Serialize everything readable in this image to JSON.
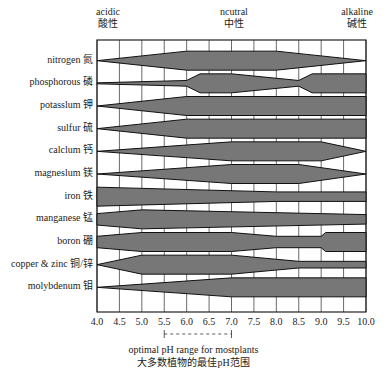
{
  "headers": {
    "acidic_en": "acidic",
    "acidic_zh": "酸性",
    "neutral_en": "ncutral",
    "neutral_zh": "中性",
    "alkaline_en": "alkaline",
    "alkaline_zh": "碱性"
  },
  "footer": {
    "line1": "optimal pH range for mostplants",
    "line2": "大多数植物的最佳pH范围"
  },
  "chart_data": {
    "type": "area",
    "xlabel": "pH",
    "xlim": [
      4.0,
      10.0
    ],
    "x_ticks": [
      "4.0",
      "4.5",
      "5.0",
      "5.5",
      "6.0",
      "6.5",
      "7.0",
      "7.5",
      "8.0",
      "8.5",
      "9.0",
      "9.5",
      "10.0"
    ],
    "grid": true,
    "optimal_range": [
      5.5,
      7.0
    ],
    "bar_color": "#777777",
    "series": [
      {
        "name": "nitrogen 氮",
        "profile": [
          [
            4.0,
            0
          ],
          [
            6.0,
            1
          ],
          [
            8.0,
            1
          ],
          [
            10.0,
            0
          ]
        ]
      },
      {
        "name": "phosphorous 磷",
        "profile": [
          [
            4.0,
            0.05
          ],
          [
            6.0,
            0.3
          ],
          [
            6.3,
            1
          ],
          [
            7.0,
            1
          ],
          [
            8.5,
            0.3
          ],
          [
            8.8,
            1
          ],
          [
            10.0,
            1
          ]
        ]
      },
      {
        "name": "potasslum 钾",
        "profile": [
          [
            4.0,
            0
          ],
          [
            6.0,
            1
          ],
          [
            10.0,
            1
          ]
        ]
      },
      {
        "name": "sulfur 硫",
        "profile": [
          [
            4.0,
            0
          ],
          [
            6.0,
            1
          ],
          [
            10.0,
            1
          ]
        ]
      },
      {
        "name": "calclum 钙",
        "profile": [
          [
            4.0,
            0
          ],
          [
            7.0,
            1
          ],
          [
            9.0,
            1
          ],
          [
            10.0,
            0
          ]
        ]
      },
      {
        "name": "magneslum 镁",
        "profile": [
          [
            4.0,
            0
          ],
          [
            7.0,
            1
          ],
          [
            8.5,
            1
          ],
          [
            10.0,
            0
          ]
        ]
      },
      {
        "name": "iron 铁",
        "profile": [
          [
            4.0,
            1
          ],
          [
            8.0,
            0.5
          ],
          [
            10.0,
            0.5
          ]
        ]
      },
      {
        "name": "manganese 锰",
        "profile": [
          [
            4.0,
            0.6
          ],
          [
            5.0,
            1
          ],
          [
            10.0,
            0.5
          ]
        ]
      },
      {
        "name": "boron 硼",
        "profile": [
          [
            4.0,
            0.6
          ],
          [
            5.0,
            1
          ],
          [
            7.0,
            1
          ],
          [
            8.0,
            0.6
          ],
          [
            9.0,
            0.6
          ],
          [
            9.1,
            1
          ],
          [
            10.0,
            1
          ]
        ]
      },
      {
        "name": "copper & zinc 铜/锌",
        "profile": [
          [
            4.0,
            0
          ],
          [
            5.0,
            1
          ],
          [
            7.0,
            1
          ],
          [
            8.5,
            0.35
          ],
          [
            10.0,
            0.35
          ]
        ]
      },
      {
        "name": "molybdenum 钼",
        "profile": [
          [
            4.0,
            0
          ],
          [
            7.0,
            1
          ],
          [
            10.0,
            1
          ]
        ]
      }
    ]
  }
}
